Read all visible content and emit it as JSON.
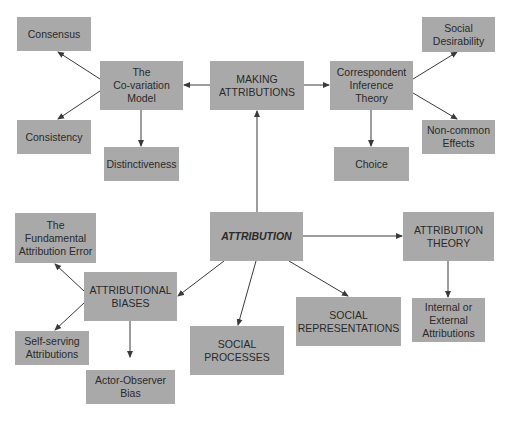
{
  "diagram": {
    "title": "ATTRIBUTION",
    "type": "concept-map",
    "colors": {
      "node_fill": "#a9a9a9",
      "text": "#2a2a2a",
      "edge": "#3a3a3a",
      "background": "#ffffff"
    },
    "nodes": {
      "consensus": {
        "label": "Consensus",
        "x": 17,
        "y": 17,
        "w": 74,
        "h": 34
      },
      "covariation": {
        "label": "The\nCo-variation\nModel",
        "x": 100,
        "y": 61,
        "w": 83,
        "h": 49
      },
      "making": {
        "label": "MAKING\nATTRIBUTIONS",
        "x": 210,
        "y": 61,
        "w": 94,
        "h": 49
      },
      "correspondent": {
        "label": "Correspondent\nInference Theory",
        "x": 330,
        "y": 61,
        "w": 83,
        "h": 49
      },
      "social_desirability": {
        "label": "Social\nDesirability",
        "x": 422,
        "y": 17,
        "w": 73,
        "h": 35
      },
      "consistency": {
        "label": "Consistency",
        "x": 17,
        "y": 120,
        "w": 74,
        "h": 34
      },
      "distinctiveness": {
        "label": "Distinctiveness",
        "x": 104,
        "y": 147,
        "w": 75,
        "h": 34
      },
      "choice": {
        "label": "Choice",
        "x": 334,
        "y": 147,
        "w": 75,
        "h": 34
      },
      "noncommon": {
        "label": "Non-common\nEffects",
        "x": 422,
        "y": 120,
        "w": 73,
        "h": 34
      },
      "fundamental": {
        "label": "The\nFundamental\nAttribution Error",
        "x": 15,
        "y": 213,
        "w": 81,
        "h": 50
      },
      "attribution": {
        "label": "ATTRIBUTION",
        "x": 210,
        "y": 212,
        "w": 93,
        "h": 49
      },
      "attribution_theory": {
        "label": "ATTRIBUTION\nTHEORY",
        "x": 403,
        "y": 212,
        "w": 91,
        "h": 49
      },
      "biases": {
        "label": "ATTRIBUTIONAL\nBIASES",
        "x": 84,
        "y": 272,
        "w": 93,
        "h": 49
      },
      "self_serving": {
        "label": "Self-serving\nAttributions",
        "x": 15,
        "y": 331,
        "w": 74,
        "h": 34
      },
      "actor_observer": {
        "label": "Actor-Observer\nBias",
        "x": 86,
        "y": 370,
        "w": 89,
        "h": 34
      },
      "social_processes": {
        "label": "SOCIAL\nPROCESSES",
        "x": 190,
        "y": 326,
        "w": 94,
        "h": 49
      },
      "social_representations": {
        "label": "SOCIAL\nREPRESENTATIONS",
        "x": 296,
        "y": 297,
        "w": 105,
        "h": 49
      },
      "internal_external": {
        "label": "Internal or\nExternal\nAttributions",
        "x": 412,
        "y": 298,
        "w": 73,
        "h": 44
      }
    },
    "edges": [
      {
        "from": "attribution",
        "to": "making",
        "x1": 257,
        "y1": 212,
        "x2": 257,
        "y2": 111
      },
      {
        "from": "making",
        "to": "covariation",
        "x1": 210,
        "y1": 85,
        "x2": 184,
        "y2": 85
      },
      {
        "from": "making",
        "to": "correspondent",
        "x1": 304,
        "y1": 85,
        "x2": 329,
        "y2": 85
      },
      {
        "from": "covariation",
        "to": "consensus",
        "x1": 100,
        "y1": 79,
        "x2": 58,
        "y2": 52
      },
      {
        "from": "covariation",
        "to": "consistency",
        "x1": 100,
        "y1": 91,
        "x2": 58,
        "y2": 119
      },
      {
        "from": "covariation",
        "to": "distinctiveness",
        "x1": 141,
        "y1": 110,
        "x2": 141,
        "y2": 146
      },
      {
        "from": "correspondent",
        "to": "social_desirability",
        "x1": 413,
        "y1": 79,
        "x2": 457,
        "y2": 52
      },
      {
        "from": "correspondent",
        "to": "noncommon",
        "x1": 413,
        "y1": 93,
        "x2": 457,
        "y2": 119
      },
      {
        "from": "correspondent",
        "to": "choice",
        "x1": 371,
        "y1": 110,
        "x2": 371,
        "y2": 146
      },
      {
        "from": "attribution",
        "to": "attribution_theory",
        "x1": 303,
        "y1": 236,
        "x2": 402,
        "y2": 236
      },
      {
        "from": "attribution",
        "to": "biases",
        "x1": 224,
        "y1": 261,
        "x2": 178,
        "y2": 296
      },
      {
        "from": "attribution",
        "to": "social_processes",
        "x1": 256,
        "y1": 261,
        "x2": 238,
        "y2": 325
      },
      {
        "from": "attribution",
        "to": "social_representations",
        "x1": 289,
        "y1": 261,
        "x2": 348,
        "y2": 296
      },
      {
        "from": "attribution_theory",
        "to": "internal_external",
        "x1": 448,
        "y1": 261,
        "x2": 448,
        "y2": 297
      },
      {
        "from": "biases",
        "to": "fundamental",
        "x1": 84,
        "y1": 291,
        "x2": 55,
        "y2": 264
      },
      {
        "from": "biases",
        "to": "self_serving",
        "x1": 84,
        "y1": 303,
        "x2": 55,
        "y2": 330
      },
      {
        "from": "biases",
        "to": "actor_observer",
        "x1": 130,
        "y1": 321,
        "x2": 130,
        "y2": 357
      }
    ]
  }
}
